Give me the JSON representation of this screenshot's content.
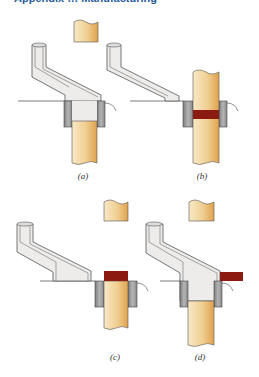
{
  "header": {
    "cropped_title": "Appendix … Manufacturing"
  },
  "colors": {
    "punch_light": "#f6e3bd",
    "punch_dark": "#e4a955",
    "hopper_fill": "#eeecea",
    "hopper_outline": "#555555",
    "bushing": "#9a9a9a",
    "compact": "#8b1a10",
    "line": "#444444"
  },
  "panels": [
    {
      "id": "a",
      "label": "(a)"
    },
    {
      "id": "b",
      "label": "(b)"
    },
    {
      "id": "c",
      "label": "(c)"
    },
    {
      "id": "d",
      "label": "(d)"
    }
  ]
}
